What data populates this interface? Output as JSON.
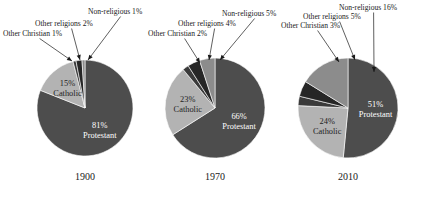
{
  "figure": {
    "background": "#ffffff",
    "width": 428,
    "height": 201
  },
  "palette": {
    "protestant": "#4d4d4d",
    "catholic": "#b3b3b3",
    "other_christian": "#3a3a3a",
    "other_religions": "#262626",
    "non_religious": "#8c8c8c",
    "text": "#1a1a1a",
    "label_on_slice": "#ffffff"
  },
  "chart_data": {
    "type": "pie",
    "title": "",
    "subtitle": "",
    "xlabel": "",
    "ylabel": "",
    "legend_position": "none",
    "grid": false,
    "categories": [
      "Protestant",
      "Catholic",
      "Other Christian",
      "Other religions",
      "Non-religious"
    ],
    "charts": [
      {
        "year": "1900",
        "center": {
          "x": 85,
          "y": 108
        },
        "radius": 48,
        "slices": [
          {
            "name": "Protestant",
            "value": 81,
            "label": "81%",
            "label_line2": "Protestant",
            "color": "#4d4d4d",
            "inside": true
          },
          {
            "name": "Catholic",
            "value": 15,
            "label": "15%",
            "label_line2": "Catholic",
            "color": "#b3b3b3",
            "inside": true
          },
          {
            "name": "Other Christian",
            "value": 1,
            "label": "Other Christian 1%",
            "color": "#3a3a3a",
            "inside": false
          },
          {
            "name": "Other religions",
            "value": 2,
            "label": "Other religions 2%",
            "color": "#262626",
            "inside": false
          },
          {
            "name": "Non-religious",
            "value": 1,
            "label": "Non-religious 1%",
            "color": "#8c8c8c",
            "inside": false
          }
        ]
      },
      {
        "year": "1970",
        "center": {
          "x": 215,
          "y": 108
        },
        "radius": 50,
        "slices": [
          {
            "name": "Protestant",
            "value": 66,
            "label": "66%",
            "label_line2": "Protestant",
            "color": "#4d4d4d",
            "inside": true
          },
          {
            "name": "Catholic",
            "value": 23,
            "label": "23%",
            "label_line2": "Catholic",
            "color": "#b3b3b3",
            "inside": true
          },
          {
            "name": "Other Christian",
            "value": 2,
            "label": "Other Christian 2%",
            "color": "#3a3a3a",
            "inside": false
          },
          {
            "name": "Other religions",
            "value": 4,
            "label": "Other religions 4%",
            "color": "#262626",
            "inside": false
          },
          {
            "name": "Non-religious",
            "value": 5,
            "label": "Non-religious 5%",
            "color": "#8c8c8c",
            "inside": false
          }
        ]
      },
      {
        "year": "2010",
        "center": {
          "x": 348,
          "y": 108
        },
        "radius": 50,
        "slices": [
          {
            "name": "Protestant",
            "value": 51,
            "label": "51%",
            "label_line2": "Protestant",
            "color": "#4d4d4d",
            "inside": true
          },
          {
            "name": "Catholic",
            "value": 24,
            "label": "24%",
            "label_line2": "Catholic",
            "color": "#b3b3b3",
            "inside": true
          },
          {
            "name": "Other Christian",
            "value": 3,
            "label": "Other Christian 3%",
            "color": "#3a3a3a",
            "inside": false
          },
          {
            "name": "Other religions",
            "value": 5,
            "label": "Other religions 5%",
            "color": "#262626",
            "inside": false
          },
          {
            "name": "Non-religious",
            "value": 16,
            "label": "Non-religious 16%",
            "color": "#8c8c8c",
            "inside": false
          }
        ]
      }
    ]
  },
  "callouts": [
    {
      "id": "c1-oc",
      "text": "Other Christian 1%",
      "x": 3,
      "y": 36,
      "anchor": "start",
      "tip": {
        "x": 72,
        "y": 61
      }
    },
    {
      "id": "c1-or",
      "text": "Other religions 2%",
      "x": 35,
      "y": 26,
      "anchor": "start",
      "tip": {
        "x": 80,
        "y": 60
      }
    },
    {
      "id": "c1-nr",
      "text": "Non-religious 1%",
      "x": 88,
      "y": 14,
      "anchor": "start",
      "tip": {
        "x": 88,
        "y": 60
      }
    },
    {
      "id": "c2-oc",
      "text": "Other Christian 2%",
      "x": 148,
      "y": 36,
      "anchor": "start",
      "tip": {
        "x": 200,
        "y": 63
      }
    },
    {
      "id": "c2-or",
      "text": "Other religions 4%",
      "x": 178,
      "y": 26,
      "anchor": "start",
      "tip": {
        "x": 209,
        "y": 60
      }
    },
    {
      "id": "c2-nr",
      "text": "Non-religious 5%",
      "x": 222,
      "y": 16,
      "anchor": "start",
      "tip": {
        "x": 220,
        "y": 60
      }
    },
    {
      "id": "c3-oc",
      "text": "Other Christian 3%",
      "x": 281,
      "y": 28,
      "anchor": "start",
      "tip": {
        "x": 339,
        "y": 62
      }
    },
    {
      "id": "c3-or",
      "text": "Other religions 5%",
      "x": 303,
      "y": 19,
      "anchor": "start",
      "tip": {
        "x": 355,
        "y": 60
      }
    },
    {
      "id": "c3-nr",
      "text": "Non-religious 16%",
      "x": 339,
      "y": 10,
      "anchor": "start",
      "tip": {
        "x": 374,
        "y": 72
      }
    }
  ],
  "years": [
    "1900",
    "1970",
    "2010"
  ]
}
